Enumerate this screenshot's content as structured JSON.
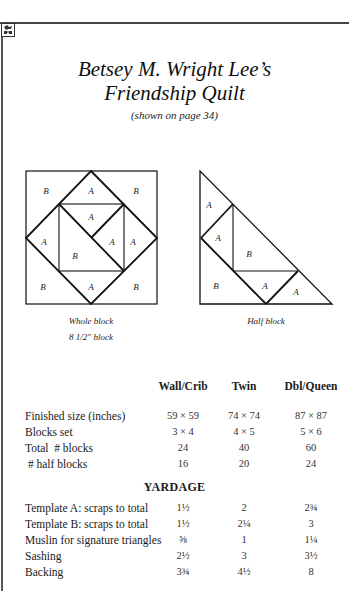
{
  "page": {
    "title_line1": "Betsey M. Wright Lee’s",
    "title_line2": "Friendship Quilt",
    "subtitle": "(shown on page 34)",
    "corner_icon": "quilt-motif-icon"
  },
  "diagrams": {
    "whole_block": {
      "caption": "Whole block",
      "size_caption": "8 1/2\" block",
      "labels": [
        "B",
        "A",
        "B",
        "A",
        "A",
        "A",
        "A",
        "B",
        "B",
        "A",
        "B"
      ]
    },
    "half_block": {
      "caption": "Half block",
      "labels": [
        "A",
        "A",
        "B",
        "B",
        "A",
        "A"
      ]
    }
  },
  "table": {
    "columns": [
      "Wall/Crib",
      "Twin",
      "Dbl/Queen"
    ],
    "rows": [
      {
        "label": "Finished size (inches)",
        "values": [
          "59 × 59",
          "74 × 74",
          "87 × 87"
        ]
      },
      {
        "label": "Blocks set",
        "values": [
          "3 × 4",
          "4 × 5",
          "5 × 6"
        ]
      },
      {
        "label": "Total  # blocks",
        "values": [
          "24",
          "40",
          "60"
        ]
      },
      {
        "label": " # half blocks",
        "values": [
          "16",
          "20",
          "24"
        ]
      }
    ]
  },
  "yardage": {
    "title": "YARDAGE",
    "rows": [
      {
        "label": "Template A: scraps to total",
        "values": [
          "1½",
          "2",
          "2¾"
        ]
      },
      {
        "label": "Template B: scraps to total",
        "values": [
          "1½",
          "2¼",
          "3"
        ]
      },
      {
        "label": "Muslin for signature triangles",
        "values": [
          "⅝",
          "1",
          "1¼"
        ]
      },
      {
        "label": "Sashing",
        "values": [
          "2½",
          "3",
          "3½"
        ]
      },
      {
        "label": "Backing",
        "values": [
          "3¾",
          "4½",
          "8"
        ]
      }
    ]
  }
}
